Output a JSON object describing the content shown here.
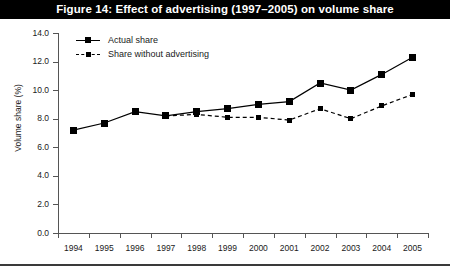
{
  "title": "Figure 14: Effect of advertising (1997–2005) on volume share",
  "legend": {
    "position": "top-left-inside",
    "items": [
      {
        "label": "Actual share",
        "style": "solid",
        "marker": "filled-square"
      },
      {
        "label": "Share without advertising",
        "style": "dashed",
        "marker": "filled-square"
      }
    ]
  },
  "axes": {
    "ylabel": "Volume share (%)",
    "yticks": [
      "14.0",
      "12.0",
      "10.0",
      "8.0",
      "6.0",
      "4.0",
      "2.0",
      "0.0"
    ],
    "xticks": [
      "1994",
      "1995",
      "1996",
      "1997",
      "1998",
      "1999",
      "2000",
      "2001",
      "2002",
      "2003",
      "2004",
      "2005"
    ]
  },
  "colors": {
    "banner_background": "#000000",
    "banner_text": "#ffffff",
    "series_line": "#000000",
    "axis": "#555555",
    "plot_background": "#ffffff"
  },
  "chart_data": {
    "type": "line",
    "title": "Figure 14: Effect of advertising (1997–2005) on volume share",
    "xlabel": "",
    "ylabel": "Volume share (%)",
    "ylim": [
      0.0,
      14.0
    ],
    "ytick_step": 2.0,
    "grid": false,
    "legend_position": "upper left",
    "categories": [
      "1994",
      "1995",
      "1996",
      "1997",
      "1998",
      "1999",
      "2000",
      "2001",
      "2002",
      "2003",
      "2004",
      "2005"
    ],
    "series": [
      {
        "name": "Actual share",
        "style": "solid",
        "marker": "filled-square",
        "values": [
          7.2,
          7.7,
          8.5,
          8.2,
          8.5,
          8.7,
          9.0,
          9.2,
          10.5,
          10.0,
          11.1,
          12.3
        ]
      },
      {
        "name": "Share without advertising",
        "style": "dashed",
        "marker": "filled-square",
        "values": [
          null,
          null,
          null,
          8.2,
          8.3,
          8.1,
          8.1,
          7.9,
          8.7,
          8.0,
          8.9,
          9.7
        ]
      }
    ]
  }
}
